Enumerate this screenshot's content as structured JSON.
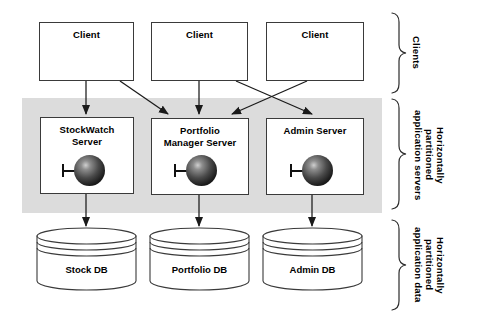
{
  "diagram": {
    "colors": {
      "band_fill": "#dcdcdc",
      "node_stroke": "#3a3a3a",
      "edge_stroke": "#1a1a1a",
      "background": "#ffffff",
      "sphere_dark": "#050505",
      "sphere_light": "#cfcfcf"
    },
    "tiers": [
      {
        "id": "clients",
        "side_label": "Clients",
        "nodes": [
          {
            "id": "client-1",
            "label": "Client"
          },
          {
            "id": "client-2",
            "label": "Client"
          },
          {
            "id": "client-3",
            "label": "Client"
          }
        ]
      },
      {
        "id": "app-servers",
        "side_label": "Horizontally\npartitioned\napplication servers",
        "nodes": [
          {
            "id": "stockwatch-server",
            "label": "StockWatch\nServer",
            "line1": "StockWatch",
            "line2": "Server"
          },
          {
            "id": "portfolio-manager-server",
            "label": "Portfolio\nManager Server",
            "line1": "Portfolio",
            "line2": "Manager Server"
          },
          {
            "id": "admin-server",
            "label": "Admin Server",
            "line1": "Admin Server",
            "line2": ""
          }
        ]
      },
      {
        "id": "app-data",
        "side_label": "Horizontally\npartitioned\napplication data",
        "nodes": [
          {
            "id": "stock-db",
            "label": "Stock DB"
          },
          {
            "id": "portfolio-db",
            "label": "Portfolio DB"
          },
          {
            "id": "admin-db",
            "label": "Admin DB"
          }
        ]
      }
    ],
    "connections": [
      {
        "from": "client-1",
        "to": "stockwatch-server"
      },
      {
        "from": "client-1",
        "to": "portfolio-manager-server"
      },
      {
        "from": "client-2",
        "to": "portfolio-manager-server"
      },
      {
        "from": "client-2",
        "to": "admin-server"
      },
      {
        "from": "client-3",
        "to": "portfolio-manager-server"
      },
      {
        "from": "stockwatch-server",
        "to": "stock-db"
      },
      {
        "from": "portfolio-manager-server",
        "to": "portfolio-db"
      },
      {
        "from": "admin-server",
        "to": "admin-db"
      }
    ]
  }
}
